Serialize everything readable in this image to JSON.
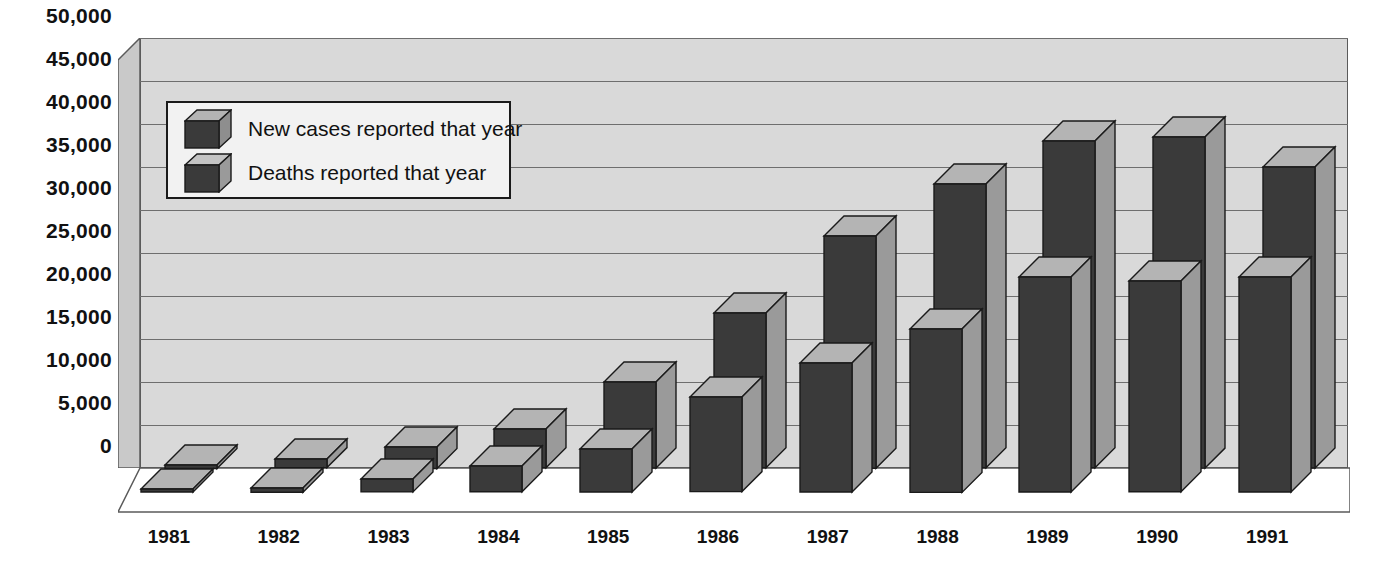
{
  "chart_data": {
    "type": "bar",
    "title": "",
    "xlabel": "",
    "ylabel": "",
    "ylim": [
      0,
      50000
    ],
    "grid": true,
    "legend_position": "inside-top-left",
    "style": "3d-clustered-depth",
    "categories": [
      "1981",
      "1982",
      "1983",
      "1984",
      "1985",
      "1986",
      "1987",
      "1988",
      "1989",
      "1990",
      "1991"
    ],
    "yticks": [
      "0",
      "5,000",
      "10,000",
      "15,000",
      "20,000",
      "25,000",
      "30,000",
      "35,000",
      "40,000",
      "45,000",
      "50,000"
    ],
    "ytick_values": [
      0,
      5000,
      10000,
      15000,
      20000,
      25000,
      30000,
      35000,
      40000,
      45000,
      50000
    ],
    "series": [
      {
        "name": "New cases reported that year",
        "values": [
          400,
          1000,
          2500,
          4500,
          10000,
          18000,
          27000,
          33000,
          38000,
          38500,
          35000
        ]
      },
      {
        "name": "Deaths reported that year",
        "values": [
          200,
          500,
          1500,
          3000,
          5000,
          11000,
          15000,
          19000,
          25000,
          24500,
          25000
        ]
      }
    ]
  },
  "legend": {
    "items": [
      {
        "label": "New cases reported that year",
        "swatch": "cube-3d-icon"
      },
      {
        "label": "Deaths reported that year",
        "swatch": "cube-3d-icon"
      }
    ]
  },
  "colors": {
    "plot_background": "#d9d9d9",
    "gridline": "#6e6e6e",
    "bar_front": "#3a3a3a",
    "bar_side": "#9a9a9a",
    "bar_top": "#b4b4b4",
    "wall_side": "#c9c9c9",
    "floor": "#ffffff",
    "outline": "#1a1a1a",
    "text": "#111111",
    "legend_background": "#f2f2f2"
  }
}
